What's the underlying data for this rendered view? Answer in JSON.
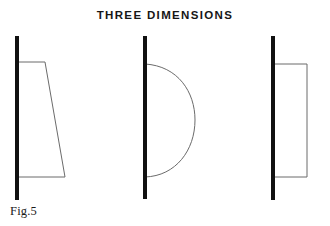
{
  "figure": {
    "title": "THREE DIMENSIONS",
    "caption": "Fig.5",
    "background_color": "#ffffff",
    "axis_color": "#111111",
    "outline_color": "#6b6b6b",
    "title_color": "#161616",
    "caption_color": "#1a1a1a"
  },
  "diagrams": [
    {
      "name": "trapezoid-profile",
      "shape": "trapezoid",
      "axis": {
        "x": 17,
        "y_top": 36,
        "y_bottom": 200,
        "thickness": 4
      },
      "profile_points": "17,62 45,62 65,177 17,177",
      "top_width": 28,
      "bottom_width": 48,
      "height": 115
    },
    {
      "name": "semicircle-profile",
      "shape": "semicircle",
      "axis": {
        "x": 145,
        "y_top": 36,
        "y_bottom": 199,
        "thickness": 4
      },
      "arc_top": {
        "x": 145,
        "y": 64
      },
      "arc_bottom": {
        "x": 145,
        "y": 177
      },
      "arc_max_x": 195,
      "radius_x": 50,
      "radius_y": 57
    },
    {
      "name": "rectangle-profile",
      "shape": "rectangle",
      "axis": {
        "x": 273,
        "y_top": 36,
        "y_bottom": 200,
        "thickness": 4
      },
      "profile_points": "273,64 307,64 307,177 273,177",
      "width": 34,
      "height": 113
    }
  ]
}
